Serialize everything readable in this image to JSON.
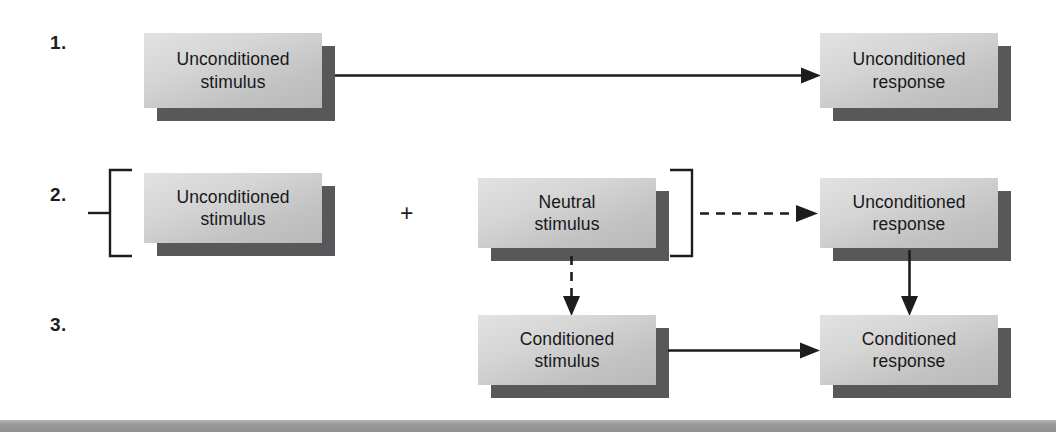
{
  "figure": {
    "background_color": "#ffffff",
    "box_face_color": "#d4d4d4",
    "box_shadow_color": "#58585a",
    "line_color": "#1d1d1d",
    "footer_bar_color": "#9a9a9a"
  },
  "steps": [
    {
      "number": "1."
    },
    {
      "number": "2."
    },
    {
      "number": "3."
    }
  ],
  "boxes": {
    "us_row1": {
      "label": "Unconditioned\nstimulus"
    },
    "ur_row1": {
      "label": "Unconditioned\nresponse"
    },
    "us_row2": {
      "label": "Unconditioned\nstimulus"
    },
    "ns_row2": {
      "label": "Neutral\nstimulus"
    },
    "ur_row2": {
      "label": "Unconditioned\nresponse"
    },
    "cs_row3": {
      "label": "Conditioned\nstimulus"
    },
    "cr_row3": {
      "label": "Conditioned\nresponse"
    }
  },
  "operators": {
    "plus": "+"
  },
  "connectors": [
    {
      "name": "us-to-ur-row1",
      "style": "solid",
      "direction": "right"
    },
    {
      "name": "pair-to-ur-row2",
      "style": "dashed",
      "direction": "right"
    },
    {
      "name": "ns-to-cs",
      "style": "dashed",
      "direction": "down"
    },
    {
      "name": "ur-to-cr",
      "style": "solid",
      "direction": "down"
    },
    {
      "name": "cs-to-cr",
      "style": "solid",
      "direction": "right"
    }
  ],
  "brackets": [
    {
      "name": "pairing-bracket-left",
      "shape": "["
    },
    {
      "name": "pairing-bracket-right",
      "shape": "]"
    }
  ]
}
